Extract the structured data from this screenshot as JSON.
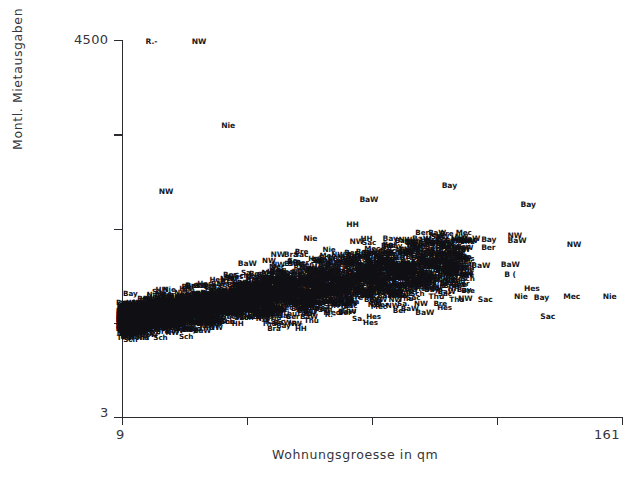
{
  "chart_data": {
    "type": "scatter",
    "title": "",
    "xlabel": "Wohnungsgroesse in qm",
    "ylabel": "Montl. Mietausgaben",
    "xlim": [
      9,
      161
    ],
    "ylim": [
      3,
      4500
    ],
    "x_tick_labels": [
      "9",
      "161"
    ],
    "y_tick_labels": [
      "4500",
      "3"
    ],
    "x_tick_count": 5,
    "y_tick_count": 5,
    "grid": false,
    "legend": false,
    "marker_style": "text-label",
    "point_label_legend": {
      "BaW": "Baden-Wuerttemberg",
      "Bay": "Bayern",
      "Ber": "Berlin",
      "Bra": "Brandenburg",
      "Bre": "Bremen",
      "HH": "Hamburg",
      "Hes": "Hessen",
      "Mec": "Mecklenburg-Vorpommern",
      "Nie": "Niedersachsen",
      "NW": "Nordrhein-Westfalen",
      "R.-": "Rheinland-Pfalz",
      "Sac": "Sachsen",
      "Sa.": "Sachsen-Anhalt",
      "Sch": "Schleswig-Holstein",
      "Thu": "Thueringen"
    },
    "points": [
      {
        "label": "R.-",
        "x": 18,
        "y": 4480,
        "sparse": true
      },
      {
        "label": "NW",
        "x": 32,
        "y": 4480,
        "sparse": true
      },
      {
        "label": "Nie",
        "x": 41,
        "y": 3470,
        "sparse": true
      },
      {
        "label": "NW",
        "x": 22,
        "y": 2690,
        "sparse": true
      },
      {
        "label": "Bay",
        "x": 108,
        "y": 2760,
        "sparse": true
      },
      {
        "label": "BaW",
        "x": 83,
        "y": 2590,
        "sparse": true
      },
      {
        "label": "Bay",
        "x": 132,
        "y": 2530,
        "sparse": true
      },
      {
        "label": "HH",
        "x": 79,
        "y": 2290,
        "sparse": true
      },
      {
        "label": "Nie",
        "x": 66,
        "y": 2130,
        "sparse": true
      },
      {
        "label": "NW",
        "x": 80,
        "y": 2090,
        "sparse": true
      },
      {
        "label": "Bay",
        "x": 90,
        "y": 2130,
        "sparse": true
      },
      {
        "label": "BaW",
        "x": 99,
        "y": 2130,
        "sparse": true
      },
      {
        "label": "Ber",
        "x": 90,
        "y": 2050,
        "sparse": true
      },
      {
        "label": "BaW",
        "x": 114,
        "y": 2130,
        "sparse": true
      },
      {
        "label": "Bay",
        "x": 120,
        "y": 2110,
        "sparse": true
      },
      {
        "label": "NW",
        "x": 128,
        "y": 2160,
        "sparse": true
      },
      {
        "label": "BaW",
        "x": 128,
        "y": 2100,
        "sparse": true
      },
      {
        "label": "NW",
        "x": 146,
        "y": 2060,
        "sparse": true
      },
      {
        "label": "R.-",
        "x": 107,
        "y": 2030,
        "sparse": true
      },
      {
        "label": "Ber",
        "x": 120,
        "y": 2020,
        "sparse": true
      },
      {
        "label": "Sac",
        "x": 63,
        "y": 1930,
        "sparse": true
      },
      {
        "label": "Bay",
        "x": 70,
        "y": 1880,
        "sparse": true
      },
      {
        "label": "Sch",
        "x": 78,
        "y": 1880,
        "sparse": true
      },
      {
        "label": "Sac",
        "x": 84,
        "y": 1880,
        "sparse": true
      },
      {
        "label": "NW",
        "x": 56,
        "y": 1940,
        "sparse": true
      },
      {
        "label": "Bra",
        "x": 60,
        "y": 1930,
        "sparse": true
      },
      {
        "label": "BaW",
        "x": 46,
        "y": 1830,
        "sparse": true
      },
      {
        "label": "Hes",
        "x": 95,
        "y": 1800,
        "sparse": true
      },
      {
        "label": "BaW",
        "x": 126,
        "y": 1820,
        "sparse": true
      },
      {
        "label": "Hes",
        "x": 108,
        "y": 1810,
        "sparse": true
      },
      {
        "label": "BaW",
        "x": 117,
        "y": 1800,
        "sparse": true
      },
      {
        "label": "B (",
        "x": 127,
        "y": 1700,
        "sparse": true
      },
      {
        "label": "Bra",
        "x": 30,
        "y": 1560,
        "sparse": true
      },
      {
        "label": "Hes",
        "x": 36,
        "y": 1520,
        "sparse": true
      },
      {
        "label": "Hes",
        "x": 133,
        "y": 1530,
        "sparse": true
      },
      {
        "label": "Nie",
        "x": 130,
        "y": 1430,
        "sparse": true
      },
      {
        "label": "Bay",
        "x": 136,
        "y": 1420,
        "sparse": true
      },
      {
        "label": "Mec",
        "x": 145,
        "y": 1440,
        "sparse": true
      },
      {
        "label": "Nie",
        "x": 157,
        "y": 1440,
        "sparse": true
      },
      {
        "label": "NW",
        "x": 113,
        "y": 1410,
        "sparse": true
      },
      {
        "label": "Sac",
        "x": 119,
        "y": 1400,
        "sparse": true
      },
      {
        "label": "Thu",
        "x": 104,
        "y": 1430,
        "sparse": true
      },
      {
        "label": "Bay",
        "x": 22,
        "y": 1320,
        "sparse": true
      },
      {
        "label": "Mec",
        "x": 26,
        "y": 1250,
        "sparse": true
      },
      {
        "label": "Sa.",
        "x": 36,
        "y": 1250,
        "sparse": true
      },
      {
        "label": "Sa.",
        "x": 47,
        "y": 1200,
        "sparse": true
      },
      {
        "label": "Mec",
        "x": 72,
        "y": 1240,
        "sparse": true
      },
      {
        "label": "BaW",
        "x": 100,
        "y": 1240,
        "sparse": true
      },
      {
        "label": "Sac",
        "x": 138,
        "y": 1190,
        "sparse": true
      }
    ],
    "dense_cluster_note": "Large overplotted mass of state abbreviation labels between roughly 15-120 qm and 1200-2000 monthly rent"
  }
}
